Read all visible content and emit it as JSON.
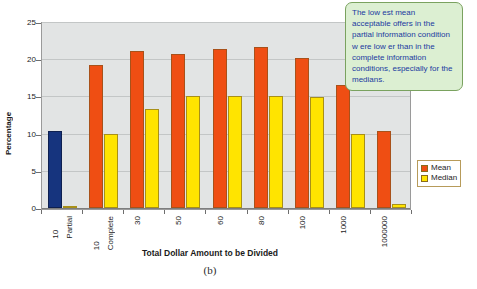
{
  "figure": {
    "caption": "(b)",
    "annotation": "The low est mean acceptable offers in the partial information condition w ere low er than in the complete information conditions, especially for the medians."
  },
  "legend": {
    "position": "right",
    "items": [
      {
        "label": "Mean",
        "color": "#ef4e13"
      },
      {
        "label": "Median",
        "color": "#ffe400"
      }
    ]
  },
  "chart_data": {
    "type": "bar",
    "title": "",
    "xlabel": "Total Dollar Amount to be Divided",
    "ylabel": "Percentage",
    "ylim": [
      0,
      25
    ],
    "yticks": [
      0,
      5,
      10,
      15,
      20,
      25
    ],
    "grid": true,
    "categories": [
      "10\nPartial",
      "10\nComplete",
      "30",
      "50",
      "60",
      "80",
      "100",
      "1000",
      "1000000"
    ],
    "category_lines": [
      [
        "10",
        "Partial"
      ],
      [
        "10",
        "Complete"
      ],
      [
        "30",
        ""
      ],
      [
        "50",
        ""
      ],
      [
        "60",
        ""
      ],
      [
        "80",
        ""
      ],
      [
        "100",
        ""
      ],
      [
        "1000",
        ""
      ],
      [
        "1000000",
        ""
      ]
    ],
    "series": [
      {
        "name": "Mean",
        "color": "#ef4e13",
        "values": [
          10.4,
          19.2,
          21.1,
          20.7,
          21.4,
          21.6,
          20.2,
          16.6,
          10.3
        ],
        "highlight_index": 0,
        "highlight_color": "#16347e"
      },
      {
        "name": "Median",
        "color": "#ffe400",
        "values": [
          0.15,
          10.0,
          13.3,
          15.0,
          15.0,
          15.0,
          14.9,
          10.0,
          0.5
        ]
      }
    ]
  }
}
